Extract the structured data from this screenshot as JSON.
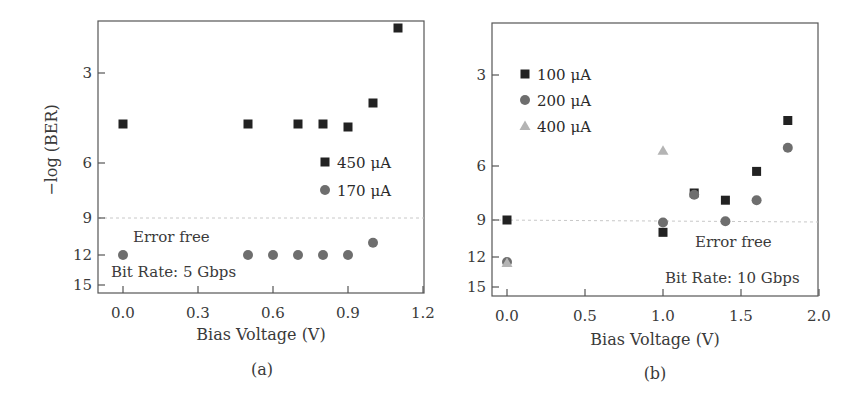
{
  "chart_data": [
    {
      "panel": "(a)",
      "type": "scatter",
      "xlabel": "Bias Voltage (V)",
      "ylabel": "−log (BER)",
      "xlim": [
        -0.1,
        1.2
      ],
      "x_ticks": [
        0.0,
        0.3,
        0.6,
        0.9,
        1.2
      ],
      "x_tick_labels": [
        "0.0",
        "0.3",
        "0.6",
        "0.9",
        "1.2"
      ],
      "y_ticks": [
        3,
        6,
        9,
        12,
        15
      ],
      "y_tick_labels": [
        "3",
        "6",
        "9",
        "12",
        "15"
      ],
      "y_inverted": true,
      "y_scale": "nonlinear",
      "threshold_line": {
        "y": 9,
        "style": "dashed"
      },
      "annotations": [
        "Error free",
        "Bit Rate: 5 Gbps"
      ],
      "legend_position": "right-middle",
      "series": [
        {
          "name": "450 μA",
          "marker": "square",
          "color": "#222222",
          "x": [
            0.0,
            0.5,
            0.7,
            0.8,
            0.9,
            1.0,
            1.1
          ],
          "y": [
            4.7,
            4.7,
            4.7,
            4.7,
            4.8,
            4.0,
            1.5
          ]
        },
        {
          "name": "170 μA",
          "marker": "circle",
          "color": "#6e6e6e",
          "x": [
            0.0,
            0.5,
            0.6,
            0.7,
            0.8,
            0.9,
            1.0
          ],
          "y": [
            12,
            12,
            12,
            12,
            12,
            12,
            11
          ]
        }
      ]
    },
    {
      "panel": "(b)",
      "type": "scatter",
      "xlabel": "Bias Voltage (V)",
      "ylabel": "",
      "xlim": [
        -0.1,
        2.0
      ],
      "x_ticks": [
        0.0,
        0.5,
        1.0,
        1.5,
        2.0
      ],
      "x_tick_labels": [
        "0.0",
        "0.5",
        "1.0",
        "1.5",
        "2.0"
      ],
      "y_ticks": [
        3,
        6,
        9,
        12,
        15
      ],
      "y_tick_labels": [
        "3",
        "6",
        "9",
        "12",
        "15"
      ],
      "y_inverted": true,
      "y_scale": "nonlinear",
      "threshold_line": {
        "y": 9,
        "style": "dashed"
      },
      "annotations": [
        "Error free",
        "Bit Rate: 10 Gbps"
      ],
      "legend_position": "upper-left",
      "series": [
        {
          "name": "100 μA",
          "marker": "square",
          "color": "#222222",
          "x": [
            0.0,
            1.0,
            1.2,
            1.4,
            1.6,
            1.8
          ],
          "y": [
            9.0,
            10.0,
            7.5,
            7.9,
            6.3,
            4.5
          ]
        },
        {
          "name": "200 μA",
          "marker": "circle",
          "color": "#6e6e6e",
          "x": [
            0.0,
            1.0,
            1.2,
            1.4,
            1.6,
            1.8
          ],
          "y": [
            12.5,
            9.2,
            7.6,
            9.1,
            7.9,
            5.4
          ]
        },
        {
          "name": "400 μA",
          "marker": "triangle",
          "color": "#b4b4b4",
          "x": [
            0.0,
            1.0
          ],
          "y": [
            12.6,
            5.5
          ]
        }
      ]
    }
  ],
  "panels": [
    {
      "caption": "(a)",
      "xlabel": "Bias Voltage (V)",
      "ylabel": "−log (BER)",
      "annotation_error_free": "Error free",
      "annotation_bit_rate": "Bit Rate: 5 Gbps"
    },
    {
      "caption": "(b)",
      "xlabel": "Bias Voltage (V)",
      "annotation_error_free": "Error free",
      "annotation_bit_rate": "Bit Rate: 10 Gbps"
    }
  ]
}
